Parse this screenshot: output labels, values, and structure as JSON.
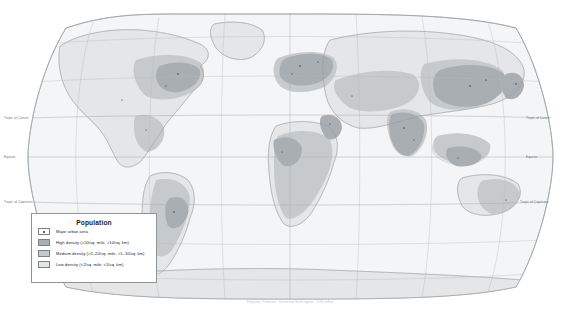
{
  "map": {
    "title": "World Population Density",
    "projection_note": "Projection: Robinson  ·  Denominal Scale approx. 1:130 million",
    "lat_lines": [
      {
        "name": "Tropic of Cancer",
        "label": "Tropic of Cancer",
        "y": 118
      },
      {
        "name": "Equator",
        "label": "Equator",
        "y": 157
      },
      {
        "name": "Tropic of Capricorn",
        "label": "Tropic of Capricorn",
        "y": 202
      }
    ],
    "colors": {
      "ocean": "#f4f5f6",
      "high_density": "#a9aeb2",
      "medium_density": "#c6cacd",
      "low_density": "#e4e6e8",
      "coastline": "#8f9499",
      "graticule": "#b9bcc0",
      "urban_dot": "#2b2e31"
    }
  },
  "legend": {
    "title": "Population",
    "items": [
      {
        "key": "major-urban-area",
        "label": "Major urban area",
        "swatch": "urban-dot"
      },
      {
        "key": "high-density",
        "label": "High density (>20/sq. mile, >10/sq. km)",
        "swatch": "#a9aeb2"
      },
      {
        "key": "medium-density",
        "label": "Medium density (>2–20/sq. mile, >1–10/sq. km)",
        "swatch": "#c6cacd"
      },
      {
        "key": "low-density",
        "label": "Low density (<2/sq. mile, <1/sq. km)",
        "swatch": "#e4e6e8"
      }
    ]
  }
}
